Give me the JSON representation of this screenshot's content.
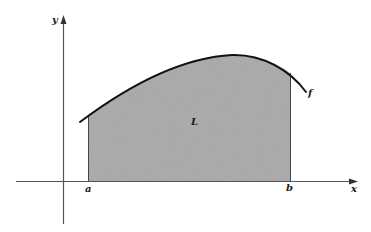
{
  "figure": {
    "labels": {
      "y_axis": "y",
      "x_axis": "x",
      "region": "L",
      "function": "f",
      "left_bound": "a",
      "right_bound": "b"
    },
    "colors": {
      "region_fill": "#a9a9a9",
      "curve": "#111111",
      "axes": "#555555",
      "bounds": "#444444",
      "background": "#ffffff"
    }
  }
}
